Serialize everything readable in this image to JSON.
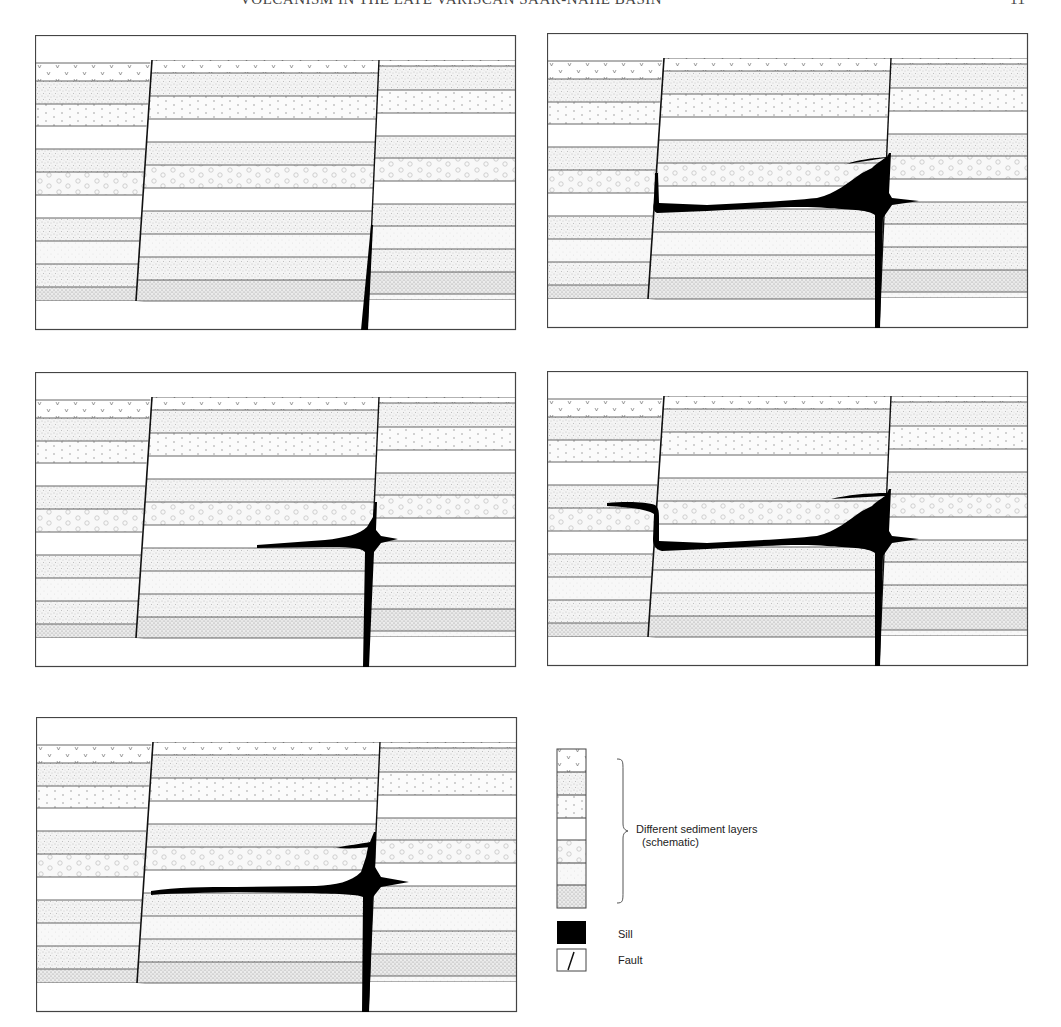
{
  "header": {
    "title": "VOLCANISM IN THE LATE VARISCAN SAAR-NAHE BASIN",
    "page_number": "11"
  },
  "colors": {
    "line": "#333333",
    "sill": "#000000",
    "stipple": "#9a9a9a",
    "background": "#ffffff"
  },
  "panels": [
    {
      "id": "stage-1",
      "description": "Fault with dike rising from base, no sill"
    },
    {
      "id": "stage-2",
      "description": "Sill spreading left along bedding, reaching left fault"
    },
    {
      "id": "stage-3",
      "description": "Sill begins to intrude at intersection of dike and fault"
    },
    {
      "id": "stage-4",
      "description": "Sill climbs left fault and spreads into left block"
    },
    {
      "id": "stage-5",
      "description": "Sill extends leftwards towards left fault"
    }
  ],
  "legend": {
    "layers_label_line1": "Different sediment layers",
    "layers_label_line2": "(schematic)",
    "sill_label": "Sill",
    "fault_label": "Fault",
    "layer_patterns": [
      "v-pattern",
      "stipple",
      "dots",
      "blank",
      "circles",
      "light-stipple",
      "dense-stipple"
    ]
  }
}
